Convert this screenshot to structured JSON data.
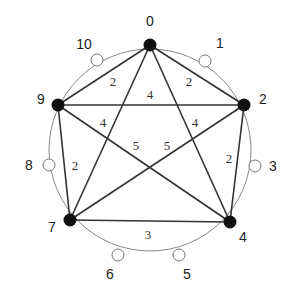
{
  "diagram": {
    "type": "graph-on-ring",
    "ring": {
      "cx": 150,
      "cy": 150,
      "r": 101,
      "color": "#888888"
    },
    "filled_nodes": [
      {
        "id": "0",
        "x": 150,
        "y": 45,
        "label": "0",
        "lx": 150,
        "ly": 26
      },
      {
        "id": "2",
        "x": 244,
        "y": 105,
        "label": "2",
        "lx": 263,
        "ly": 104
      },
      {
        "id": "4",
        "x": 230,
        "y": 222,
        "label": "4",
        "lx": 243,
        "ly": 242
      },
      {
        "id": "7",
        "x": 70,
        "y": 220,
        "label": "7",
        "lx": 52,
        "ly": 232
      },
      {
        "id": "9",
        "x": 58,
        "y": 105,
        "label": "9",
        "lx": 41,
        "ly": 104
      }
    ],
    "open_nodes": [
      {
        "id": "1",
        "x": 205,
        "y": 61,
        "label": "1",
        "lx": 220,
        "ly": 48
      },
      {
        "id": "3",
        "x": 255,
        "y": 166,
        "label": "3",
        "lx": 273,
        "ly": 171
      },
      {
        "id": "5",
        "x": 179,
        "y": 255,
        "label": "5",
        "lx": 187,
        "ly": 279
      },
      {
        "id": "6",
        "x": 118,
        "y": 255,
        "label": "6",
        "lx": 110,
        "ly": 279
      },
      {
        "id": "8",
        "x": 49,
        "y": 165,
        "label": "8",
        "lx": 29,
        "ly": 170
      },
      {
        "id": "10",
        "x": 97,
        "y": 60,
        "label": "10",
        "lx": 84,
        "ly": 49
      }
    ],
    "edges": [
      {
        "from": "0",
        "to": "9",
        "weight": "2",
        "lx": 113,
        "ly": 86
      },
      {
        "from": "0",
        "to": "2",
        "weight": "2",
        "lx": 189,
        "ly": 86
      },
      {
        "from": "9",
        "to": "2",
        "weight": "4",
        "lx": 150,
        "ly": 99
      },
      {
        "from": "9",
        "to": "4",
        "weight": "4",
        "lx": 103,
        "ly": 127
      },
      {
        "from": "2",
        "to": "7",
        "weight": "4",
        "lx": 195,
        "ly": 127
      },
      {
        "from": "0",
        "to": "7",
        "weight": "5",
        "lx": 136,
        "ly": 150
      },
      {
        "from": "0",
        "to": "4",
        "weight": "5",
        "lx": 167,
        "ly": 150
      },
      {
        "from": "9",
        "to": "7",
        "weight": "2",
        "lx": 75,
        "ly": 170
      },
      {
        "from": "2",
        "to": "4",
        "weight": "2",
        "lx": 229,
        "ly": 163
      },
      {
        "from": "7",
        "to": "4",
        "weight": "3",
        "lx": 148,
        "ly": 239
      }
    ],
    "colors": {
      "edge": "#333333",
      "node_fill": "#111111",
      "open_fill": "#ffffff",
      "open_stroke": "#777777"
    }
  }
}
